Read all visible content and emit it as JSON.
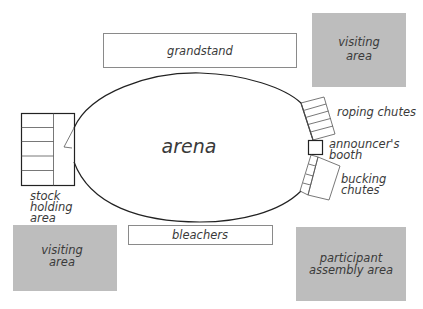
{
  "diagram": {
    "colors": {
      "background": "#ffffff",
      "area_fill": "#bdbdbd",
      "outline": "#222222",
      "box_outline": "#8a8a8a",
      "text": "#3a3a3a"
    },
    "labels": {
      "grandstand": "grandstand",
      "arena": "arena",
      "bleachers": "bleachers",
      "visiting_area_top": [
        "visiting",
        "area"
      ],
      "visiting_area_bottom": [
        "visiting",
        "area"
      ],
      "participant_area": [
        "participant",
        "assembly area"
      ],
      "stock_holding": [
        "stock",
        "holding",
        "area"
      ],
      "roping_chutes": "roping chutes",
      "announcers_booth": [
        "announcer's",
        "booth"
      ],
      "bucking_chutes": [
        "bucking",
        "chutes"
      ]
    }
  }
}
